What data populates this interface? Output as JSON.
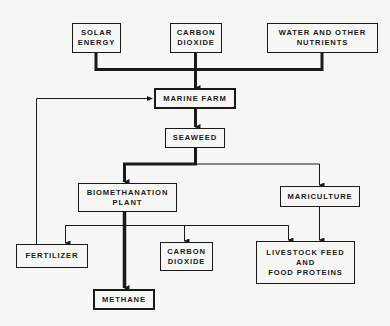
{
  "diagram": {
    "type": "flowchart",
    "colors": {
      "ink": "#1a1a1a",
      "background": "#f7f7f5"
    },
    "nodes": {
      "solar_energy": {
        "label": "SOLAR\nENERGY"
      },
      "carbon_dioxide_input": {
        "label": "CARBON\nDIOXIDE"
      },
      "water_nutrients": {
        "label": "WATER AND OTHER\nNUTRIENTS"
      },
      "marine_farm": {
        "label": "MARINE FARM"
      },
      "seaweed": {
        "label": "SEAWEED"
      },
      "biomethanation_plant": {
        "label": "BIOMETHANATION\nPLANT"
      },
      "mariculture": {
        "label": "MARICULTURE"
      },
      "fertilizer": {
        "label": "FERTILIZER"
      },
      "carbon_dioxide_output": {
        "label": "CARBON\nDIOXIDE"
      },
      "livestock_feed": {
        "label": "LIVESTOCK FEED\nAND\nFOOD PROTEINS"
      },
      "methane": {
        "label": "METHANE"
      }
    },
    "edges": [
      {
        "from": "solar_energy",
        "to": "marine_farm",
        "weight": "thick"
      },
      {
        "from": "carbon_dioxide_input",
        "to": "marine_farm",
        "weight": "thick"
      },
      {
        "from": "water_nutrients",
        "to": "marine_farm",
        "weight": "thick"
      },
      {
        "from": "marine_farm",
        "to": "seaweed",
        "weight": "thick"
      },
      {
        "from": "seaweed",
        "to": "biomethanation_plant",
        "weight": "thick"
      },
      {
        "from": "seaweed",
        "to": "mariculture",
        "weight": "thin"
      },
      {
        "from": "biomethanation_plant",
        "to": "methane",
        "weight": "thick"
      },
      {
        "from": "biomethanation_plant",
        "to": "fertilizer",
        "weight": "thin"
      },
      {
        "from": "biomethanation_plant",
        "to": "carbon_dioxide_output",
        "weight": "thin"
      },
      {
        "from": "biomethanation_plant",
        "to": "livestock_feed",
        "weight": "thin"
      },
      {
        "from": "mariculture",
        "to": "livestock_feed",
        "weight": "thin"
      },
      {
        "from": "fertilizer",
        "to": "marine_farm",
        "weight": "thin"
      }
    ]
  }
}
